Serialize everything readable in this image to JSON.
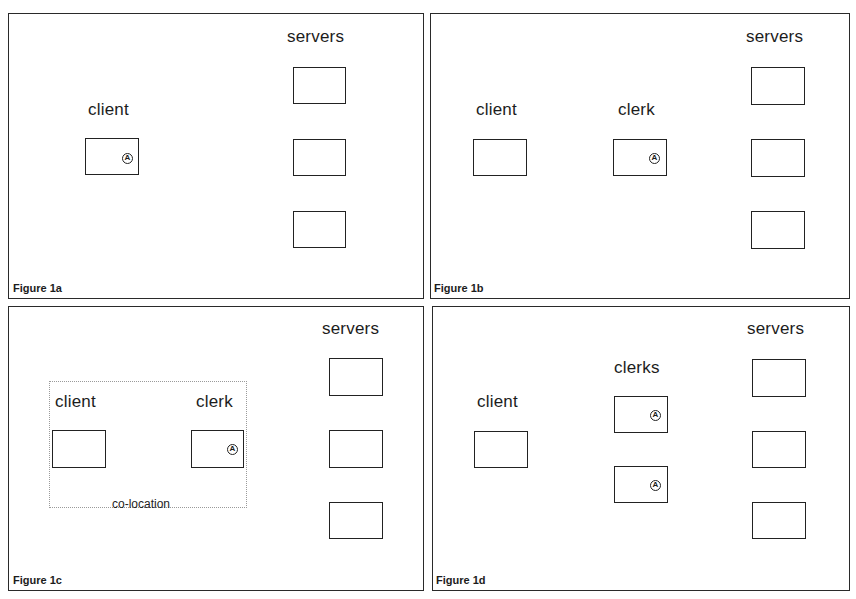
{
  "panels": {
    "a": {
      "caption": "Figure 1a",
      "labels": {
        "client": "client",
        "servers": "servers"
      },
      "clock_glyph": "A"
    },
    "b": {
      "caption": "Figure 1b",
      "labels": {
        "client": "client",
        "clerk": "clerk",
        "servers": "servers"
      },
      "clock_glyph": "A"
    },
    "c": {
      "caption": "Figure 1c",
      "labels": {
        "client": "client",
        "clerk": "clerk",
        "servers": "servers",
        "colocation": "co-location"
      },
      "clock_glyph": "A"
    },
    "d": {
      "caption": "Figure 1d",
      "labels": {
        "client": "client",
        "clerks": "clerks",
        "servers": "servers"
      },
      "clock_glyph": "A"
    }
  },
  "icons": {
    "clock": "timer-icon"
  },
  "colors": {
    "ink": "#222222",
    "background": "#ffffff",
    "dotted": "#9a9a9a"
  }
}
